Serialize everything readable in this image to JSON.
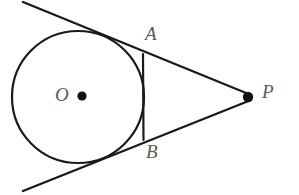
{
  "figure": {
    "type": "geometry-diagram",
    "background_color": "#ffffff",
    "stroke_color": "#1a1a1a",
    "label_color": "#5a5a5a"
  },
  "labels": {
    "center": "O",
    "tangent_point_upper": "A",
    "tangent_point_lower": "B",
    "external_point": "P"
  },
  "geometry": {
    "circle": {
      "cx": 78,
      "cy": 97,
      "r": 66,
      "stroke_width": 2.2
    },
    "center_dot": {
      "cx": 82,
      "cy": 96,
      "r": 4.6
    },
    "external_point_dot": {
      "cx": 248,
      "cy": 97,
      "r": 5.2
    },
    "tangent_line_upper": {
      "x1": 23,
      "y1": 2,
      "x2": 251,
      "y2": 95,
      "stroke_width": 2.4
    },
    "tangent_line_lower": {
      "x1": 23,
      "y1": 191,
      "x2": 251,
      "y2": 100,
      "stroke_width": 2.4
    },
    "chord_ab": {
      "x1": 143,
      "y1": 54,
      "x2": 143.5,
      "y2": 140,
      "stroke_width": 2.2
    }
  }
}
